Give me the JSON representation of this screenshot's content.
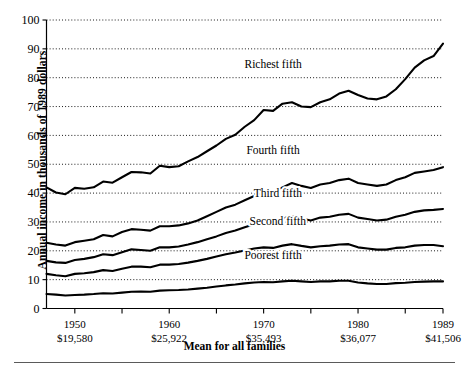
{
  "chart_data": {
    "type": "line",
    "title": "",
    "xlabel": "Mean for all families",
    "ylabel": "Annual income in thousands of 1989 dollars",
    "ylim": [
      0,
      100
    ],
    "xlim": [
      1947,
      1989
    ],
    "grid": true,
    "legend_position": "inline-labels",
    "yticks": [
      0,
      10,
      20,
      30,
      40,
      50,
      60,
      70,
      80,
      90,
      100
    ],
    "xticks": [
      1950,
      1955,
      1960,
      1965,
      1970,
      1975,
      1980,
      1985,
      1989
    ],
    "xtick_labeled": [
      {
        "year": 1950,
        "label": "1950",
        "mean": "$19,580"
      },
      {
        "year": 1960,
        "label": "1960",
        "mean": "$25,922"
      },
      {
        "year": 1970,
        "label": "1970",
        "mean": "$35,493"
      },
      {
        "year": 1980,
        "label": "1980",
        "mean": "$36,077"
      },
      {
        "year": 1989,
        "label": "1989",
        "mean": "$41,506"
      }
    ],
    "x": [
      1947,
      1948,
      1949,
      1950,
      1951,
      1952,
      1953,
      1954,
      1955,
      1956,
      1957,
      1958,
      1959,
      1960,
      1961,
      1962,
      1963,
      1964,
      1965,
      1966,
      1967,
      1968,
      1969,
      1970,
      1971,
      1972,
      1973,
      1974,
      1975,
      1976,
      1977,
      1978,
      1979,
      1980,
      1981,
      1982,
      1983,
      1984,
      1985,
      1986,
      1987,
      1988,
      1989
    ],
    "series": [
      {
        "name": "Richest fifth",
        "label": "Richest fifth",
        "label_x": 1971.0,
        "label_y": 83.5,
        "values": [
          42.0,
          40.2,
          39.6,
          41.8,
          41.5,
          42.0,
          44.0,
          43.6,
          45.5,
          47.3,
          47.2,
          46.8,
          49.5,
          49.0,
          49.3,
          51.0,
          52.5,
          54.5,
          56.5,
          58.8,
          60.2,
          63.0,
          65.3,
          68.8,
          68.5,
          71.0,
          71.5,
          70.0,
          69.8,
          71.5,
          72.5,
          74.5,
          75.5,
          74.0,
          72.8,
          72.5,
          73.5,
          76.0,
          79.5,
          83.5,
          86.0,
          87.5,
          91.8
        ]
      },
      {
        "name": "Fourth fifth",
        "label": "Fourth fifth",
        "label_x": 1971.0,
        "label_y": 53.5,
        "values": [
          22.8,
          22.2,
          21.8,
          23.0,
          23.5,
          24.0,
          25.5,
          25.0,
          26.5,
          27.5,
          27.3,
          27.0,
          28.5,
          28.5,
          28.8,
          29.5,
          30.5,
          32.0,
          33.5,
          35.0,
          36.0,
          37.5,
          39.0,
          40.5,
          40.5,
          42.0,
          43.5,
          42.5,
          41.8,
          43.0,
          43.5,
          44.5,
          45.0,
          43.5,
          43.0,
          42.5,
          43.0,
          44.5,
          45.5,
          47.0,
          47.5,
          48.0,
          49.0
        ]
      },
      {
        "name": "Third fifth",
        "label": "Third fifth",
        "label_x": 1971.5,
        "label_y": 38.5,
        "values": [
          16.5,
          16.0,
          15.8,
          16.8,
          17.2,
          17.8,
          18.8,
          18.5,
          19.5,
          20.5,
          20.3,
          20.0,
          21.2,
          21.2,
          21.5,
          22.2,
          23.0,
          24.0,
          25.0,
          26.2,
          27.0,
          28.2,
          29.2,
          30.0,
          30.0,
          31.2,
          32.0,
          31.2,
          30.5,
          31.5,
          31.8,
          32.5,
          32.8,
          31.5,
          31.0,
          30.5,
          30.8,
          31.8,
          32.5,
          33.5,
          34.0,
          34.2,
          34.5
        ]
      },
      {
        "name": "Second fifth",
        "label": "Second fifth",
        "label_x": 1971.5,
        "label_y": 29.0,
        "values": [
          12.0,
          11.5,
          11.2,
          12.0,
          12.2,
          12.6,
          13.3,
          13.0,
          13.8,
          14.5,
          14.5,
          14.3,
          15.2,
          15.2,
          15.4,
          15.9,
          16.5,
          17.2,
          18.0,
          18.8,
          19.4,
          20.1,
          20.8,
          21.2,
          21.0,
          21.8,
          22.3,
          21.7,
          21.2,
          21.6,
          21.8,
          22.2,
          22.3,
          21.2,
          20.8,
          20.4,
          20.4,
          21.0,
          21.2,
          21.8,
          22.0,
          22.0,
          21.6
        ]
      },
      {
        "name": "Poorest fifth",
        "label": "Poorest fifth",
        "label_x": 1971.0,
        "label_y": 17.0,
        "values": [
          5.0,
          4.8,
          4.5,
          4.7,
          4.8,
          5.0,
          5.3,
          5.2,
          5.5,
          5.8,
          5.9,
          5.8,
          6.2,
          6.3,
          6.4,
          6.6,
          6.9,
          7.2,
          7.6,
          8.0,
          8.3,
          8.7,
          9.0,
          9.2,
          9.1,
          9.4,
          9.6,
          9.4,
          9.2,
          9.4,
          9.4,
          9.6,
          9.6,
          9.0,
          8.7,
          8.5,
          8.5,
          8.8,
          8.9,
          9.2,
          9.3,
          9.4,
          9.4
        ]
      }
    ]
  },
  "axis": {
    "ylabel_text": "Annual income in thousands of 1989 dollars",
    "xlabel_text": "Mean for all families"
  }
}
